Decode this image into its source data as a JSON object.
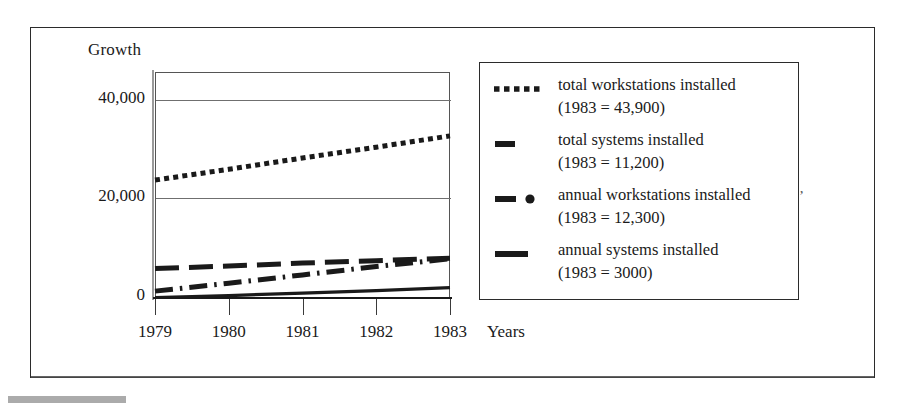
{
  "chart_data": {
    "type": "line",
    "title": "",
    "ylabel": "Growth",
    "xlabel": "Years",
    "categories": [
      "1979",
      "1980",
      "1981",
      "1982",
      "1983"
    ],
    "x": [
      1979,
      1980,
      1981,
      1982,
      1983
    ],
    "ylim": [
      0,
      46000
    ],
    "y_ticks": [
      "0",
      "20,000",
      "40,000"
    ],
    "y_tick_values": [
      0,
      20000,
      40000
    ],
    "grid": "horizontal",
    "legend_position": "right",
    "series": [
      {
        "name": "total workstations installed",
        "note": "(1983 = 43,900)",
        "style": "dotted",
        "values": [
          24000,
          26200,
          28500,
          30700,
          33000
        ]
      },
      {
        "name": "total systems installed",
        "note": "(1983 = 11,200)",
        "style": "dashed",
        "values": [
          6000,
          6500,
          7100,
          7600,
          8100
        ]
      },
      {
        "name": "annual workstations installed",
        "note": "(1983 = 12,300)",
        "style": "dash-dot",
        "values": [
          1400,
          3000,
          4700,
          6400,
          8000
        ]
      },
      {
        "name": "annual systems installed",
        "note": "(1983 = 3000)",
        "style": "solid",
        "values": [
          100,
          500,
          1000,
          1500,
          2100
        ]
      }
    ]
  },
  "axes": {
    "y_title": "Growth",
    "x_title": "Years",
    "y_tick_40000": "40,000",
    "y_tick_20000": "20,000",
    "y_tick_0": "0",
    "x_tick_1979": "1979",
    "x_tick_1980": "1980",
    "x_tick_1981": "1981",
    "x_tick_1982": "1982",
    "x_tick_1983": "1983"
  },
  "legend": {
    "entries": [
      {
        "swatch": "dotted-line-swatch",
        "label": "total workstations installed",
        "sub": "(1983 = 43,900)"
      },
      {
        "swatch": "short-dash-line-swatch",
        "label": "total systems installed",
        "sub": "(1983 = 11,200)"
      },
      {
        "swatch": "dash-dot-line-swatch",
        "label": "annual workstations installed",
        "sub": "(1983 = 12,300)"
      },
      {
        "swatch": "solid-line-swatch",
        "label": "annual systems installed",
        "sub": "(1983 = 3000)"
      }
    ]
  },
  "artifacts": {
    "stray_mark": "’"
  },
  "colors": {
    "ink": "#1a1a1a",
    "gridline": "#6f6f6f",
    "frame": "#2b2b2b",
    "paper": "#ffffff"
  }
}
